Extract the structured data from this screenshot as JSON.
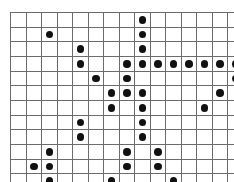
{
  "figure": {
    "kind": "sparse-matrix-dot-grid",
    "title": "",
    "background_color": "#ffffff",
    "grid_line_color": "#6b6b6b",
    "dot_color": "#111111",
    "rows": 12,
    "cols": 15,
    "cell_width_px": 14.5,
    "cell_height_px": 13.7,
    "origin_x_px": 10,
    "origin_y_px": 12
  },
  "chart_data": {
    "type": "heatmap",
    "title": "",
    "xlabel": "",
    "ylabel": "",
    "grid": true,
    "legend": "none",
    "rows": 12,
    "cols": 15,
    "xlim": [
      0,
      15
    ],
    "ylim": [
      0,
      12
    ],
    "marker": "filled-circle",
    "filled_cells": [
      [
        0,
        8
      ],
      [
        1,
        2
      ],
      [
        1,
        8
      ],
      [
        2,
        4
      ],
      [
        2,
        8
      ],
      [
        3,
        4
      ],
      [
        3,
        7
      ],
      [
        3,
        8
      ],
      [
        3,
        9
      ],
      [
        3,
        10
      ],
      [
        3,
        11
      ],
      [
        3,
        12
      ],
      [
        3,
        13
      ],
      [
        3,
        14
      ],
      [
        4,
        5
      ],
      [
        4,
        7
      ],
      [
        4,
        14
      ],
      [
        5,
        6
      ],
      [
        5,
        7
      ],
      [
        5,
        8
      ],
      [
        5,
        13
      ],
      [
        6,
        6
      ],
      [
        6,
        8
      ],
      [
        6,
        12
      ],
      [
        7,
        4
      ],
      [
        7,
        8
      ],
      [
        8,
        4
      ],
      [
        8,
        8
      ],
      [
        9,
        2
      ],
      [
        9,
        7
      ],
      [
        9,
        9
      ],
      [
        10,
        1
      ],
      [
        10,
        2
      ],
      [
        10,
        7
      ],
      [
        10,
        9
      ],
      [
        11,
        2
      ],
      [
        11,
        6
      ],
      [
        11,
        10
      ]
    ],
    "matrix": [
      [
        0,
        0,
        0,
        0,
        0,
        0,
        0,
        0,
        1,
        0,
        0,
        0,
        0,
        0,
        0
      ],
      [
        0,
        0,
        1,
        0,
        0,
        0,
        0,
        0,
        1,
        0,
        0,
        0,
        0,
        0,
        0
      ],
      [
        0,
        0,
        0,
        0,
        1,
        0,
        0,
        0,
        1,
        0,
        0,
        0,
        0,
        0,
        0
      ],
      [
        0,
        0,
        0,
        0,
        1,
        0,
        0,
        1,
        1,
        1,
        1,
        1,
        1,
        1,
        1
      ],
      [
        0,
        0,
        0,
        0,
        0,
        1,
        0,
        1,
        0,
        0,
        0,
        0,
        0,
        0,
        1
      ],
      [
        0,
        0,
        0,
        0,
        0,
        0,
        1,
        1,
        1,
        0,
        0,
        0,
        0,
        1,
        0
      ],
      [
        0,
        0,
        0,
        0,
        0,
        0,
        1,
        0,
        1,
        0,
        0,
        0,
        1,
        0,
        0
      ],
      [
        0,
        0,
        0,
        0,
        1,
        0,
        0,
        0,
        1,
        0,
        0,
        0,
        0,
        0,
        0
      ],
      [
        0,
        0,
        0,
        0,
        1,
        0,
        0,
        0,
        1,
        0,
        0,
        0,
        0,
        0,
        0
      ],
      [
        0,
        0,
        1,
        0,
        0,
        0,
        0,
        1,
        0,
        1,
        0,
        0,
        0,
        0,
        0
      ],
      [
        0,
        1,
        1,
        0,
        0,
        0,
        0,
        1,
        0,
        1,
        0,
        0,
        0,
        0,
        0
      ],
      [
        0,
        0,
        1,
        0,
        0,
        0,
        1,
        0,
        0,
        0,
        1,
        0,
        0,
        0,
        0
      ]
    ],
    "filled_count": 38,
    "total_cells": 180
  }
}
